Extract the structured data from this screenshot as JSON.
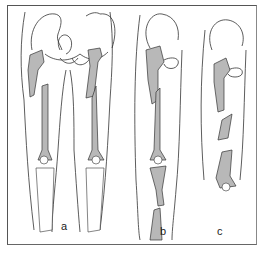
{
  "figure": {
    "panels": [
      {
        "label": "a",
        "content": "Bilateral femoral shaft fractures, both legs, anterior view"
      },
      {
        "label": "b",
        "content": "Femoral shaft fracture with tibia/fibula fracture (floating knee)"
      },
      {
        "label": "c",
        "content": "Segmental femoral fracture"
      }
    ]
  },
  "colors": {
    "bone_fill": "#b8b8b8",
    "outline": "#333333",
    "frame": "#555555",
    "background": "#ffffff"
  }
}
